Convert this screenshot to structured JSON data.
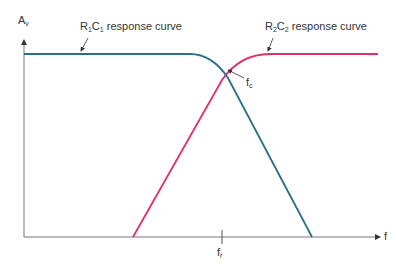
{
  "diagram": {
    "y_axis_label": "A",
    "y_axis_sub": "v",
    "x_axis_label": "f",
    "curve1": {
      "r": "R",
      "r_sub": "1",
      "c": "C",
      "c_sub": "1",
      "suffix": " response curve",
      "color": "#2a6f8a"
    },
    "curve2": {
      "r": "R",
      "r_sub": "2",
      "c": "C",
      "c_sub": "2",
      "suffix": " response curve",
      "color": "#e0306a"
    },
    "crossover": {
      "label": "f",
      "sub": "c"
    },
    "resonance": {
      "label": "f",
      "sub": "r"
    }
  }
}
